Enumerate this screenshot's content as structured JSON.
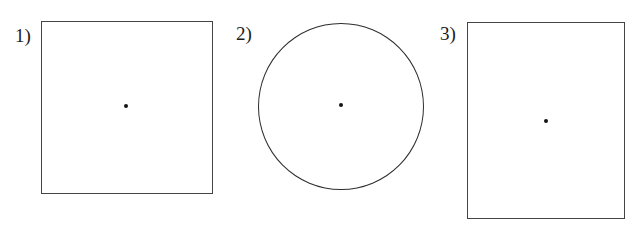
{
  "figure": {
    "background_color": "#ffffff",
    "stroke_color": "#444444",
    "dot_color": "#141414",
    "width": 640,
    "height": 228,
    "items": [
      {
        "label": "1)",
        "shape": "square",
        "shape_name": "square-outline",
        "dot_name": "center-dot",
        "has_center_dot": true,
        "x": 41,
        "y": 21,
        "width": 172,
        "height": 173,
        "center_x": 126,
        "center_y": 106
      },
      {
        "label": "2)",
        "shape": "circle",
        "shape_name": "circle-outline",
        "dot_name": "center-dot",
        "has_center_dot": true,
        "x": 258,
        "y": 23,
        "width": 166,
        "height": 167,
        "center_x": 341,
        "center_y": 105
      },
      {
        "label": "3)",
        "shape": "rectangle",
        "shape_name": "rectangle-outline",
        "dot_name": "center-dot",
        "has_center_dot": true,
        "x": 467,
        "y": 22,
        "width": 158,
        "height": 197,
        "center_x": 546,
        "center_y": 121
      }
    ]
  }
}
